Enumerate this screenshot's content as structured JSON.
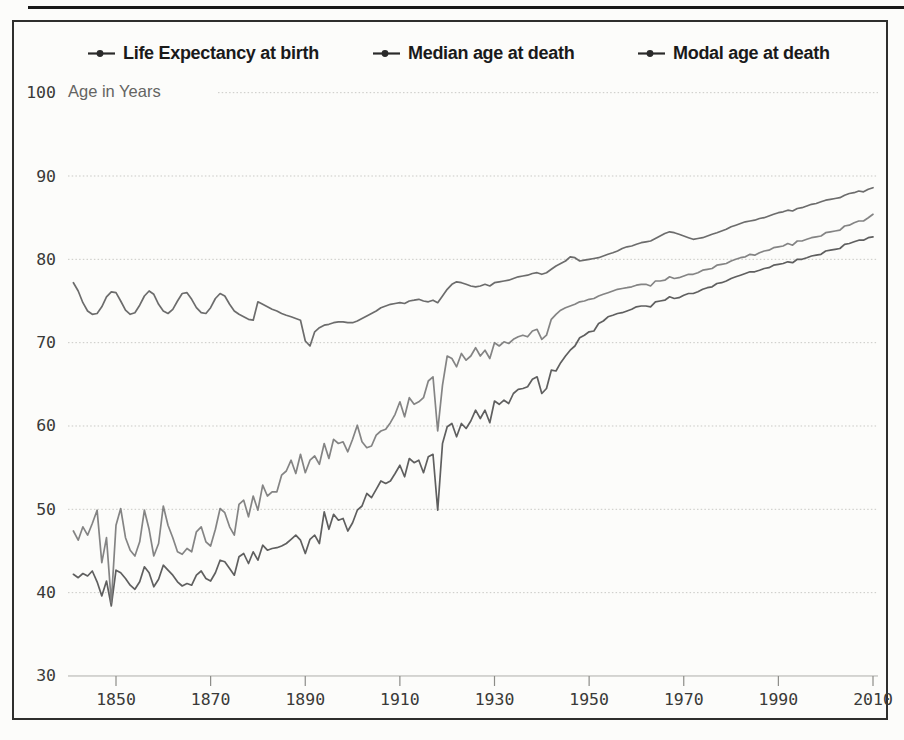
{
  "figure": {
    "background": "#fcfcfa",
    "frame_color": "#2f2f2d",
    "grid_color": "#c9c9c5",
    "axis_line_color": "#aeaeaa",
    "tick_mark_color": "#8c8c88",
    "tick_label_color": "#3a3a38",
    "legend_text_color": "#1a1a1a"
  },
  "chart_data": {
    "type": "line",
    "title": "",
    "xlabel": "",
    "ylabel": "Age in Years",
    "xlim": [
      1838,
      2012
    ],
    "ylim": [
      28,
      102
    ],
    "xticks": [
      1850,
      1870,
      1890,
      1910,
      1930,
      1950,
      1970,
      1990,
      2010
    ],
    "yticks": [
      100,
      90,
      80,
      70,
      60,
      50,
      40,
      30
    ],
    "grid": true,
    "legend_position": "top",
    "x_start_year": 1841,
    "x_end_year": 2010,
    "series": [
      {
        "name": "Life Expectancy at birth",
        "color": "#515151",
        "values": [
          42.2,
          41.8,
          42.3,
          42.0,
          42.6,
          41.3,
          39.6,
          41.4,
          38.4,
          42.7,
          42.4,
          41.7,
          40.9,
          40.4,
          41.3,
          43.1,
          42.4,
          40.7,
          41.6,
          43.3,
          42.7,
          42.1,
          41.3,
          40.8,
          41.1,
          40.9,
          42.1,
          42.6,
          41.7,
          41.4,
          42.4,
          43.9,
          43.7,
          42.9,
          42.1,
          44.3,
          44.7,
          43.5,
          44.9,
          43.9,
          45.7,
          45.1,
          45.3,
          45.4,
          45.6,
          45.9,
          46.4,
          46.9,
          46.3,
          44.7,
          46.4,
          46.9,
          45.9,
          49.7,
          47.6,
          49.4,
          48.7,
          48.9,
          47.4,
          48.4,
          49.9,
          50.4,
          51.9,
          51.4,
          52.4,
          53.4,
          53.1,
          53.4,
          54.3,
          55.3,
          53.9,
          56.1,
          55.6,
          55.9,
          54.4,
          56.3,
          56.6,
          49.9,
          57.9,
          59.9,
          60.3,
          58.7,
          60.3,
          59.7,
          60.6,
          61.9,
          60.9,
          61.9,
          60.4,
          63.0,
          62.6,
          63.1,
          62.7,
          63.9,
          64.4,
          64.5,
          64.7,
          65.6,
          65.9,
          63.9,
          64.5,
          66.7,
          66.6,
          67.6,
          68.4,
          69.1,
          69.6,
          70.6,
          70.9,
          71.3,
          71.4,
          72.3,
          72.6,
          73.1,
          73.3,
          73.5,
          73.6,
          73.8,
          74.0,
          74.3,
          74.4,
          74.4,
          74.3,
          74.9,
          75.0,
          75.1,
          75.5,
          75.3,
          75.4,
          75.7,
          75.9,
          75.9,
          76.1,
          76.4,
          76.6,
          76.7,
          77.1,
          77.2,
          77.4,
          77.7,
          77.9,
          78.1,
          78.3,
          78.5,
          78.5,
          78.7,
          78.9,
          79.0,
          79.3,
          79.4,
          79.5,
          79.7,
          79.6,
          80.0,
          80.0,
          80.2,
          80.4,
          80.5,
          80.6,
          81.0,
          81.1,
          81.2,
          81.3,
          81.8,
          81.9,
          82.1,
          82.3,
          82.3,
          82.6,
          82.7
        ]
      },
      {
        "name": "Median age at death",
        "color": "#7a7a7a",
        "values": [
          47.4,
          46.3,
          47.9,
          46.9,
          48.3,
          49.9,
          43.6,
          46.6,
          38.8,
          48.1,
          50.1,
          46.6,
          45.1,
          44.4,
          46.1,
          49.9,
          47.6,
          44.4,
          45.9,
          50.4,
          48.1,
          46.6,
          44.9,
          44.6,
          45.3,
          44.9,
          47.3,
          47.9,
          46.1,
          45.6,
          47.6,
          50.1,
          49.6,
          47.9,
          46.9,
          50.6,
          51.1,
          49.1,
          51.6,
          49.9,
          52.9,
          51.6,
          52.1,
          52.1,
          54.1,
          54.6,
          55.9,
          54.3,
          56.6,
          54.4,
          55.9,
          56.4,
          55.4,
          57.9,
          56.1,
          58.4,
          57.9,
          58.1,
          56.9,
          58.4,
          60.1,
          58.1,
          57.4,
          57.6,
          58.9,
          59.4,
          59.6,
          60.4,
          61.4,
          62.9,
          61.1,
          63.4,
          62.6,
          62.9,
          63.4,
          65.4,
          65.9,
          59.4,
          64.9,
          68.4,
          68.1,
          67.1,
          68.7,
          67.9,
          68.4,
          69.4,
          68.4,
          69.1,
          68.1,
          70.0,
          69.6,
          70.1,
          69.9,
          70.4,
          70.7,
          70.9,
          70.7,
          71.4,
          71.6,
          70.4,
          70.9,
          72.8,
          73.4,
          73.9,
          74.2,
          74.4,
          74.6,
          74.9,
          75.0,
          75.2,
          75.3,
          75.6,
          75.8,
          76.0,
          76.2,
          76.4,
          76.5,
          76.6,
          76.7,
          76.9,
          77.0,
          77.0,
          76.8,
          77.4,
          77.4,
          77.5,
          77.9,
          77.7,
          77.8,
          78.0,
          78.2,
          78.2,
          78.4,
          78.7,
          78.8,
          78.9,
          79.3,
          79.4,
          79.5,
          79.8,
          80.0,
          80.2,
          80.3,
          80.6,
          80.5,
          80.8,
          81.0,
          81.1,
          81.4,
          81.5,
          81.6,
          81.9,
          81.7,
          82.2,
          82.2,
          82.4,
          82.6,
          82.7,
          82.8,
          83.2,
          83.3,
          83.4,
          83.5,
          84.0,
          84.1,
          84.4,
          84.6,
          84.6,
          85.0,
          85.4
        ]
      },
      {
        "name": "Modal age at death",
        "color": "#5f5f5f",
        "values": [
          77.2,
          76.2,
          74.8,
          73.8,
          73.4,
          73.5,
          74.3,
          75.5,
          76.1,
          76.0,
          75.0,
          73.9,
          73.4,
          73.6,
          74.5,
          75.6,
          76.2,
          75.8,
          74.6,
          73.8,
          73.5,
          74.0,
          75.0,
          75.9,
          76.0,
          75.2,
          74.2,
          73.6,
          73.5,
          74.2,
          75.3,
          75.9,
          75.6,
          74.6,
          73.8,
          73.4,
          73.1,
          72.8,
          72.7,
          74.9,
          74.6,
          74.3,
          74.0,
          73.8,
          73.5,
          73.3,
          73.1,
          72.9,
          72.7,
          70.2,
          69.6,
          71.3,
          71.8,
          72.1,
          72.2,
          72.4,
          72.5,
          72.5,
          72.4,
          72.4,
          72.6,
          72.9,
          73.2,
          73.5,
          73.8,
          74.2,
          74.4,
          74.6,
          74.7,
          74.8,
          74.7,
          75.0,
          75.1,
          75.2,
          75.0,
          74.9,
          75.1,
          74.8,
          75.6,
          76.4,
          77.0,
          77.3,
          77.2,
          77.0,
          76.8,
          76.7,
          76.8,
          77.0,
          76.8,
          77.2,
          77.3,
          77.4,
          77.5,
          77.7,
          77.9,
          78.0,
          78.1,
          78.3,
          78.4,
          78.2,
          78.4,
          78.8,
          79.2,
          79.5,
          79.8,
          80.3,
          80.2,
          79.8,
          79.9,
          80.0,
          80.1,
          80.2,
          80.4,
          80.6,
          80.8,
          81.0,
          81.3,
          81.5,
          81.6,
          81.8,
          82.0,
          82.1,
          82.2,
          82.5,
          82.8,
          83.1,
          83.3,
          83.2,
          83.0,
          82.8,
          82.6,
          82.4,
          82.5,
          82.6,
          82.8,
          83.0,
          83.2,
          83.4,
          83.6,
          83.9,
          84.1,
          84.3,
          84.5,
          84.6,
          84.7,
          84.9,
          85.0,
          85.2,
          85.4,
          85.6,
          85.7,
          85.9,
          85.8,
          86.1,
          86.2,
          86.4,
          86.6,
          86.7,
          86.9,
          87.1,
          87.2,
          87.3,
          87.4,
          87.7,
          87.9,
          88.0,
          88.2,
          88.1,
          88.4,
          88.6
        ]
      }
    ]
  }
}
